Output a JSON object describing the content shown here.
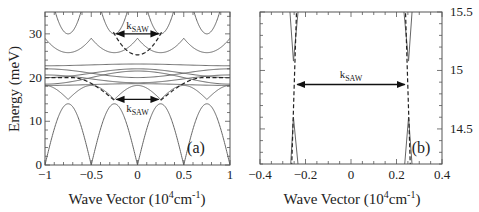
{
  "chart_data": [
    {
      "type": "line",
      "panel_label": "(a)",
      "xlabel": "Wave Vector (10^4 cm^-1)",
      "xlabel_parts": {
        "main": "Wave Vector (10",
        "sup1": "4",
        "mid": "cm",
        "sup2": "-1",
        "end": ")"
      },
      "ylabel": "Energy (meV)",
      "xlim": [
        -1,
        1
      ],
      "ylim": [
        0,
        35
      ],
      "xticks": [
        -1,
        -0.5,
        0,
        0.5,
        1
      ],
      "xtick_labels": [
        "-1",
        "-0.5",
        "0",
        "0.5",
        "1"
      ],
      "yticks": [
        0,
        10,
        20,
        30
      ],
      "ytick_labels": [
        "0",
        "10",
        "20",
        "30"
      ],
      "series": [
        {
          "name": "lowest band (folded)",
          "style": "solid",
          "description": "arches with zeros at k=-1,-0.5,0,0.5,1 and peaks ~14 meV at k=±0.25,±0.75"
        },
        {
          "name": "second band",
          "style": "solid",
          "description": "cusps ~15.3 meV at ±0.75 and ~14.8 at ±0.25, rising to ~18 meV"
        },
        {
          "name": "flat bands",
          "style": "solid",
          "values_meV": [
            18.3,
            19.5,
            21.0,
            22.0,
            23.0
          ]
        },
        {
          "name": "upper band",
          "style": "solid",
          "description": "minima ~25.7 meV at k=0,±0.5, cusps ~29 meV at ±0.25,±0.75"
        },
        {
          "name": "top band",
          "style": "solid",
          "description": "parabolic minima ~30 meV at ±0.25,±0.75 rising above 35 meV"
        },
        {
          "name": "unfolded dispersion (lower)",
          "style": "dashed",
          "description": "from ~20 meV at k=±1 down to ~14.8 meV at k=±0.25"
        },
        {
          "name": "unfolded dispersion (upper)",
          "style": "dashed",
          "description": "from ~30 meV at k=±0.25 to ~25.2 meV at k=0"
        }
      ],
      "annotations": [
        {
          "text": "k",
          "sub": "SAW",
          "from_x": -0.25,
          "to_x": 0.25,
          "y": 30.0
        },
        {
          "text": "k",
          "sub": "SAW",
          "from_x": -0.25,
          "to_x": 0.25,
          "y": 15.0
        }
      ]
    },
    {
      "type": "line",
      "panel_label": "(b)",
      "xlabel": "Wave Vector (10^4 cm^-1)",
      "xlabel_parts": {
        "main": "Wave Vector (10",
        "sup1": "4",
        "mid": "cm",
        "sup2": "-1",
        "end": ")"
      },
      "ylabel": "",
      "xlim": [
        -0.4,
        0.4
      ],
      "ylim": [
        14.2,
        15.5
      ],
      "xticks": [
        -0.4,
        -0.2,
        0,
        0.2,
        0.4
      ],
      "xtick_labels": [
        "-0.4",
        "-0.2",
        "0",
        "0.2",
        "0.4"
      ],
      "yticks": [
        14.5,
        15,
        15.5
      ],
      "ytick_labels": [
        "14.5",
        "15",
        "15.5"
      ],
      "y_axis_side": "right",
      "series": [
        {
          "name": "upper gap branch",
          "style": "solid",
          "description": "V-shaped minima ~15.08 meV near k=±0.25"
        },
        {
          "name": "lower gap branch",
          "style": "solid",
          "description": "inverted-V maxima ~14.6 meV near k=±0.25"
        },
        {
          "name": "unfolded dispersion",
          "style": "dashed",
          "description": "near-vertical lines crossing k≈±0.25"
        }
      ],
      "annotations": [
        {
          "text": "k",
          "sub": "SAW",
          "from_x": -0.245,
          "to_x": 0.245,
          "y": 14.88
        }
      ]
    }
  ]
}
